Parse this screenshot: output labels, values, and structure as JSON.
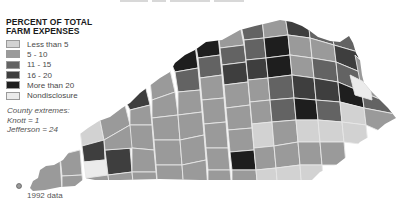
{
  "legend": {
    "title_line1": "PERCENT OF TOTAL",
    "title_line2": "FARM EXPENSES",
    "items": [
      {
        "label": "Less than 5",
        "color": "#d2d2d2"
      },
      {
        "label": "5 - 10",
        "color": "#9a9a9a"
      },
      {
        "label": "11 - 15",
        "color": "#636363"
      },
      {
        "label": "16 - 20",
        "color": "#3e3e3e"
      },
      {
        "label": "More than 20",
        "color": "#1e1e1e"
      },
      {
        "label": "Nondisclosure",
        "color": "#ebebeb"
      }
    ]
  },
  "extremes": {
    "heading": "County extremes:",
    "min": "Knott = 1",
    "max": "Jefferson = 24"
  },
  "footnote": "1992 data"
}
